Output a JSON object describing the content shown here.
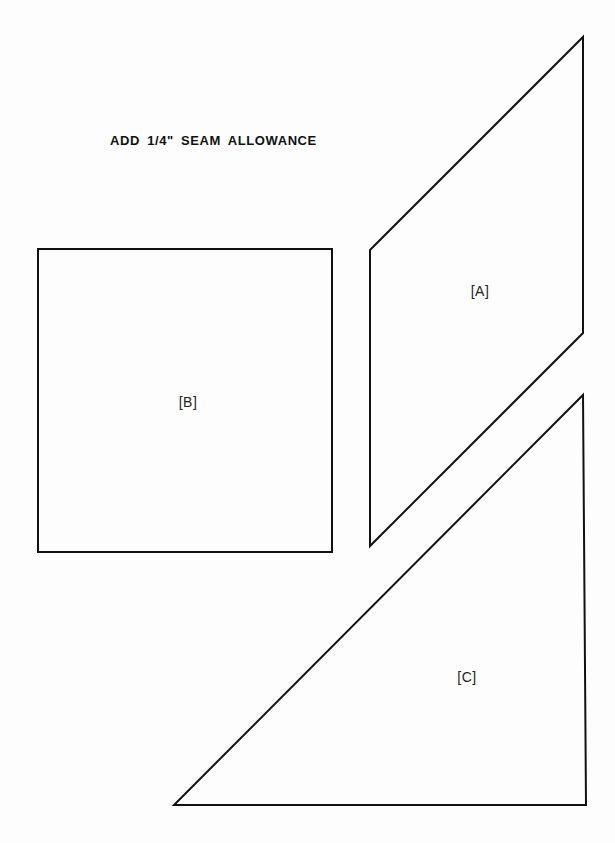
{
  "document": {
    "heading": "ADD 1/4\" SEAM ALLOWANCE",
    "stroke_color": "#111111",
    "background_color": "#fdfdfd"
  },
  "shapes": [
    {
      "id": "A",
      "label": "[A]",
      "type": "parallelogram",
      "points": [
        [
          370,
          250
        ],
        [
          583,
          37
        ],
        [
          583,
          333
        ],
        [
          370,
          546
        ]
      ],
      "label_pos": [
        480,
        291
      ]
    },
    {
      "id": "B",
      "label": "[B]",
      "type": "square",
      "points": [
        [
          38,
          249
        ],
        [
          332,
          249
        ],
        [
          332,
          552
        ],
        [
          38,
          552
        ]
      ],
      "label_pos": [
        188,
        402
      ]
    },
    {
      "id": "C",
      "label": "[C]",
      "type": "right-triangle",
      "points": [
        [
          583,
          395
        ],
        [
          586,
          805
        ],
        [
          174,
          805
        ]
      ],
      "label_pos": [
        467,
        677
      ]
    }
  ]
}
